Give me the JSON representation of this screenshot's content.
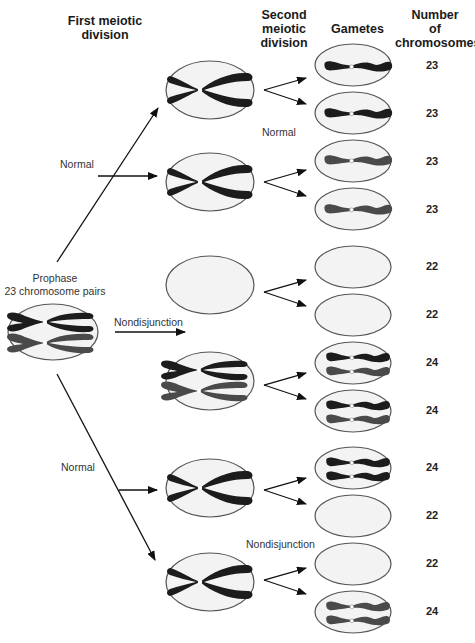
{
  "headers": {
    "first_meiotic": "First meiotic division",
    "first_meiotic_l1": "First meiotic",
    "first_meiotic_l2": "division",
    "second_meiotic_l1": "Second",
    "second_meiotic_l2": "meiotic",
    "second_meiotic_l3": "division",
    "gametes": "Gametes",
    "number_l1": "Number",
    "number_l2": "of",
    "number_l3": "chromosomes"
  },
  "labels": {
    "prophase_l1": "Prophase",
    "prophase_l2": "23 chromosome pairs",
    "normal_upper": "Normal",
    "normal_lower": "Normal",
    "nondisjunction_first": "Nondisjunction",
    "normal_second": "Normal",
    "nondisjunction_second": "Nondisjunction"
  },
  "gametes": [
    {
      "count": "23",
      "chromosomes": 1
    },
    {
      "count": "23",
      "chromosomes": 1
    },
    {
      "count": "23",
      "chromosomes": 1
    },
    {
      "count": "23",
      "chromosomes": 1
    },
    {
      "count": "22",
      "chromosomes": 0
    },
    {
      "count": "22",
      "chromosomes": 0
    },
    {
      "count": "24",
      "chromosomes": 2
    },
    {
      "count": "24",
      "chromosomes": 2
    },
    {
      "count": "24",
      "chromosomes": 2
    },
    {
      "count": "22",
      "chromosomes": 0
    },
    {
      "count": "22",
      "chromosomes": 0
    },
    {
      "count": "24",
      "chromosomes": 2
    }
  ],
  "colors": {
    "cell_fill": "#f3f3f3",
    "cell_stroke": "#555555",
    "chromosome_dark": "#1c1c1c",
    "chromosome_gray": "#4a4a4a",
    "arrow": "#111111"
  }
}
